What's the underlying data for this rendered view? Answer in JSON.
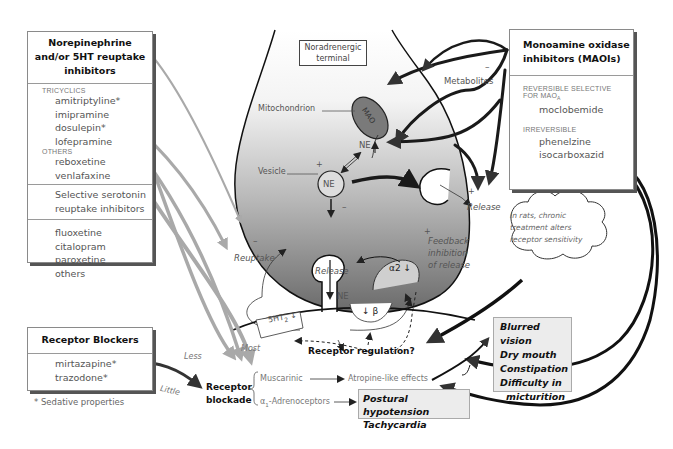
{
  "reuptake_box": {
    "title_lines": [
      "Norepinephrine",
      "and/or 5HT reuptake",
      "inhibitors"
    ],
    "sections": [
      {
        "category": "Tricyclics",
        "drugs": [
          "amitriptyline*",
          "imipramine",
          "dosulepin*",
          "lofepramine"
        ]
      },
      {
        "category": "Others",
        "drugs": [
          "reboxetine",
          "venlafaxine"
        ]
      }
    ],
    "ssri_title_lines": [
      "Selective serotonin",
      "reuptake inhibitors"
    ],
    "ssri_drugs": [
      "fluoxetine",
      "citalopram",
      "paroxetine",
      "others"
    ]
  },
  "blockers_box": {
    "title": "Receptor Blockers",
    "drugs": [
      "mirtazapine*",
      "trazodone*"
    ],
    "footnote": "* Sedative properties"
  },
  "maoi_box": {
    "title_lines": [
      "Monoamine oxidase",
      "inhibitors (MAOIs)"
    ],
    "reversible_label_1": "Reversible selective",
    "reversible_label_2": "for MAO",
    "reversible_sub": "A",
    "reversible_drugs": [
      "moclobemide"
    ],
    "irreversible_label": "Irreversible",
    "irreversible_drugs": [
      "phenelzine",
      "isocarboxazid"
    ]
  },
  "terminal": {
    "label_lines": [
      "Noradrenergic",
      "terminal"
    ],
    "mitochondrion": "Mitochondrion",
    "mao": "MAO",
    "metabolites": "Metabolites",
    "ne_up": "NE",
    "vesicle": "Vesicle",
    "vesicle_ne": "NE",
    "alpha2": "α2",
    "release_right": "Release",
    "release_bottom": "Release",
    "reuptake": "Reuptake",
    "ne_synapse": "NE",
    "feedback_lines": [
      "Feedback",
      "inhibition",
      "of release"
    ],
    "plus": "+",
    "minus": "–"
  },
  "postsynaptic": {
    "ht2": "5HT",
    "ht2_sub": "2",
    "beta": "β",
    "receptor_regulation": "Receptor regulation?",
    "most": "Most",
    "less": "Less",
    "little": "Little"
  },
  "cloud": {
    "lines": [
      "In rats, chronic",
      "treatment alters",
      "receptor sensitivity"
    ]
  },
  "blockade": {
    "label_lines": [
      "Receptor",
      "blockade"
    ],
    "muscarinic": "Muscarinic",
    "atropine": "Atropine-like effects",
    "alpha1": "α",
    "alpha1_sub": "1",
    "alpha1_rest": "-Adrenoceptors"
  },
  "effects": {
    "anticholinergic": [
      "Blurred vision",
      "Dry mouth",
      "Constipation",
      "Difficulty in",
      "micturition"
    ],
    "cardiovascular": [
      "Postural hypotension",
      "Tachycardia"
    ]
  },
  "colors": {
    "gray_arrow": "#a9a9a9",
    "dark_arrow": "#1a1a1a",
    "mao_fill": "#7a7a7a",
    "terminal_top": "#ffffff",
    "terminal_bottom": "#6e6e6e",
    "effect_box": "#ececec"
  }
}
